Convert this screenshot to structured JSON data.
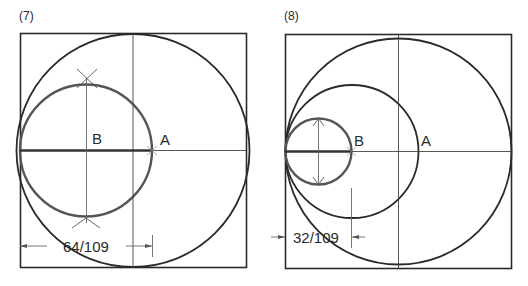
{
  "figures": [
    {
      "id": "fig7",
      "label": "(7)",
      "point_a": "A",
      "point_b": "B",
      "dimension": "64/109"
    },
    {
      "id": "fig8",
      "label": "(8)",
      "point_a": "A",
      "point_b": "B",
      "dimension": "32/109"
    }
  ],
  "colors": {
    "line": "#2a2a2a",
    "thin": "#555555",
    "circle_b": "#4a4a4a"
  }
}
